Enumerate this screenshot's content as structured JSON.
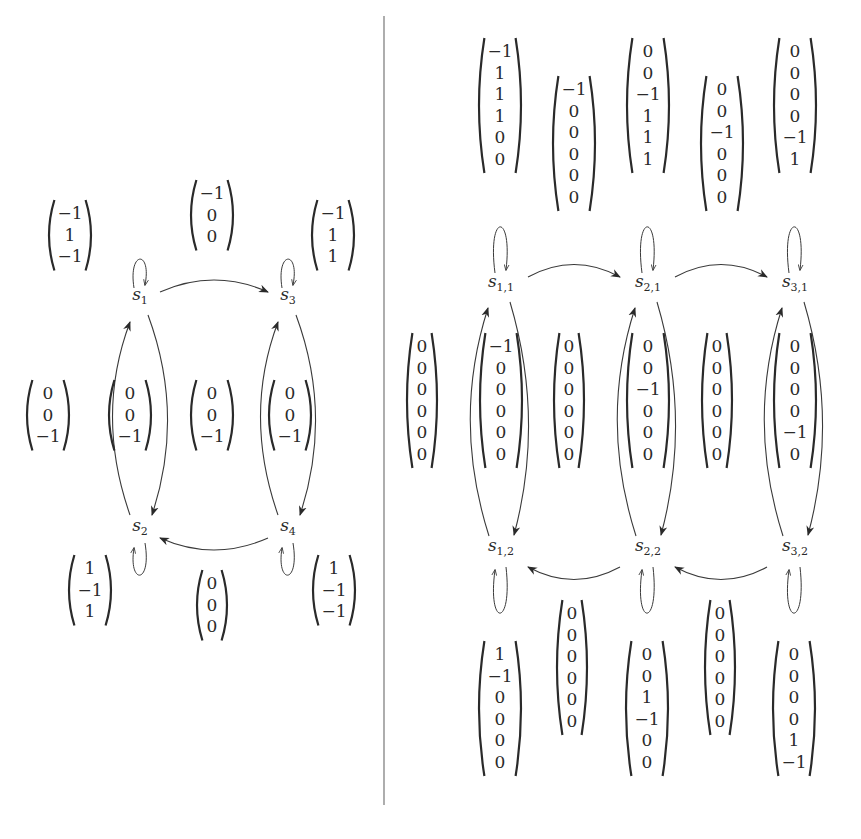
{
  "colors": {
    "ink": "#2a2a2a",
    "divider": "#777777",
    "background": "#ffffff"
  },
  "left_graph": {
    "nodes": [
      {
        "id": "s1",
        "base": "s",
        "sub": "1",
        "x": 140,
        "y": 300
      },
      {
        "id": "s3",
        "base": "s",
        "sub": "3",
        "x": 288,
        "y": 300
      },
      {
        "id": "s2",
        "base": "s",
        "sub": "2",
        "x": 140,
        "y": 531
      },
      {
        "id": "s4",
        "base": "s",
        "sub": "4",
        "x": 288,
        "y": 531
      }
    ],
    "vectors": [
      {
        "label": "self-loop-s1",
        "entries": [
          "−1",
          "1",
          "−1"
        ],
        "x": 70,
        "y": 200
      },
      {
        "label": "edge-s1-s3",
        "entries": [
          "−1",
          "0",
          "0"
        ],
        "x": 212,
        "y": 180
      },
      {
        "label": "self-loop-s3",
        "entries": [
          "−1",
          "1",
          "1"
        ],
        "x": 333,
        "y": 200
      },
      {
        "label": "left-outer",
        "entries": [
          "0",
          "0",
          "−1"
        ],
        "x": 48,
        "y": 380
      },
      {
        "label": "edges-s1-s2",
        "entries": [
          "0",
          "0",
          "−1"
        ],
        "x": 130,
        "y": 380
      },
      {
        "label": "middle",
        "entries": [
          "0",
          "0",
          "−1"
        ],
        "x": 212,
        "y": 380
      },
      {
        "label": "edges-s3-s4",
        "entries": [
          "0",
          "0",
          "−1"
        ],
        "x": 290,
        "y": 380
      },
      {
        "label": "self-loop-s2",
        "entries": [
          "1",
          "−1",
          "1"
        ],
        "x": 90,
        "y": 555
      },
      {
        "label": "edge-s4-s2",
        "entries": [
          "0",
          "0",
          "0"
        ],
        "x": 212,
        "y": 570
      },
      {
        "label": "self-loop-s4",
        "entries": [
          "1",
          "−1",
          "−1"
        ],
        "x": 334,
        "y": 555
      }
    ]
  },
  "right_graph": {
    "nodes": [
      {
        "id": "s11",
        "base": "s",
        "sub": "1,1",
        "x": 501,
        "y": 287
      },
      {
        "id": "s21",
        "base": "s",
        "sub": "2,1",
        "x": 648,
        "y": 287
      },
      {
        "id": "s31",
        "base": "s",
        "sub": "3,1",
        "x": 795,
        "y": 287
      },
      {
        "id": "s12",
        "base": "s",
        "sub": "1,2",
        "x": 501,
        "y": 551
      },
      {
        "id": "s22",
        "base": "s",
        "sub": "2,2",
        "x": 648,
        "y": 551
      },
      {
        "id": "s32",
        "base": "s",
        "sub": "3,2",
        "x": 795,
        "y": 551
      }
    ],
    "vectors": [
      {
        "label": "self-loop-s11",
        "entries": [
          "−1",
          "1",
          "1",
          "1",
          "0",
          "0"
        ],
        "x": 500,
        "y": 38
      },
      {
        "label": "edge-s11-s21",
        "entries": [
          "−1",
          "0",
          "0",
          "0",
          "0",
          "0"
        ],
        "x": 574,
        "y": 76
      },
      {
        "label": "self-loop-s21",
        "entries": [
          "0",
          "0",
          "−1",
          "1",
          "1",
          "1"
        ],
        "x": 648,
        "y": 38
      },
      {
        "label": "edge-s21-s31",
        "entries": [
          "0",
          "0",
          "−1",
          "0",
          "0",
          "0"
        ],
        "x": 722,
        "y": 76
      },
      {
        "label": "self-loop-s31",
        "entries": [
          "0",
          "0",
          "0",
          "0",
          "−1",
          "1"
        ],
        "x": 795,
        "y": 38
      },
      {
        "label": "left-outer",
        "entries": [
          "0",
          "0",
          "0",
          "0",
          "0",
          "0"
        ],
        "x": 422,
        "y": 333
      },
      {
        "label": "edges-s11-s12",
        "entries": [
          "−1",
          "0",
          "0",
          "0",
          "0",
          "0"
        ],
        "x": 501,
        "y": 333
      },
      {
        "label": "between-1-2",
        "entries": [
          "0",
          "0",
          "0",
          "0",
          "0",
          "0"
        ],
        "x": 569,
        "y": 333
      },
      {
        "label": "edges-s21-s22",
        "entries": [
          "0",
          "0",
          "−1",
          "0",
          "0",
          "0"
        ],
        "x": 648,
        "y": 333
      },
      {
        "label": "between-2-3",
        "entries": [
          "0",
          "0",
          "0",
          "0",
          "0",
          "0"
        ],
        "x": 717,
        "y": 333
      },
      {
        "label": "edges-s31-s32",
        "entries": [
          "0",
          "0",
          "0",
          "0",
          "−1",
          "0"
        ],
        "x": 795,
        "y": 333
      },
      {
        "label": "self-loop-s12",
        "entries": [
          "1",
          "−1",
          "0",
          "0",
          "0",
          "0"
        ],
        "x": 500,
        "y": 641
      },
      {
        "label": "edge-s22-s12",
        "entries": [
          "0",
          "0",
          "0",
          "0",
          "0",
          "0"
        ],
        "x": 572,
        "y": 600
      },
      {
        "label": "self-loop-s22",
        "entries": [
          "0",
          "0",
          "1",
          "−1",
          "0",
          "0"
        ],
        "x": 647,
        "y": 641
      },
      {
        "label": "edge-s32-s22",
        "entries": [
          "0",
          "0",
          "0",
          "0",
          "0",
          "0"
        ],
        "x": 720,
        "y": 600
      },
      {
        "label": "self-loop-s32",
        "entries": [
          "0",
          "0",
          "0",
          "0",
          "1",
          "−1"
        ],
        "x": 794,
        "y": 641
      }
    ]
  }
}
